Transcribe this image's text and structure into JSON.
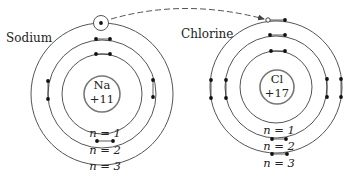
{
  "diagram": {
    "colors": {
      "stroke": "#555555",
      "electron": "#111111",
      "text": "#222222",
      "background": "#ffffff"
    },
    "atoms": [
      {
        "id": "sodium",
        "name": "Sodium",
        "symbol": "Na",
        "charge": "+11",
        "center": [
          102,
          94
        ],
        "nucleus_r": 18,
        "shells": [
          {
            "label": "n = 1",
            "r": 40
          },
          {
            "label": "n = 2",
            "r": 54
          },
          {
            "label": "n = 3",
            "r": 71
          }
        ],
        "electron_counts": {
          "n1": 2,
          "n2": 8,
          "n3": 1
        }
      },
      {
        "id": "chlorine",
        "name": "Chlorine",
        "symbol": "Cl",
        "charge": "+17",
        "center": [
          276,
          87
        ],
        "nucleus_r": 17,
        "shells": [
          {
            "label": "n = 1",
            "r": 36
          },
          {
            "label": "n = 2",
            "r": 51
          },
          {
            "label": "n = 3",
            "r": 66
          }
        ],
        "electron_counts": {
          "n1": 2,
          "n2": 8,
          "n3": 7
        },
        "vacancy": "n3"
      }
    ],
    "transfer_arrow": {
      "from": "sodium n=3 electron",
      "to": "chlorine n=3 vacancy",
      "style": "dashed"
    }
  }
}
